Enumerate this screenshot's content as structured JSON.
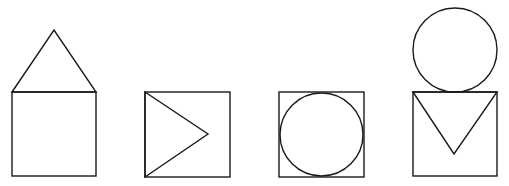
{
  "diagram": {
    "stroke_color": "#1a1a1a",
    "background": "#ffffff",
    "figures": [
      {
        "name": "triangle-above-square",
        "shapes": [
          {
            "type": "square",
            "x": 12,
            "y": 92,
            "size": 84
          },
          {
            "type": "triangle",
            "points": [
              [
                12,
                92
              ],
              [
                54,
                30
              ],
              [
                96,
                92
              ]
            ]
          }
        ]
      },
      {
        "name": "triangle-inside-square-pointing-right",
        "shapes": [
          {
            "type": "square",
            "x": 145,
            "y": 92,
            "size": 85
          },
          {
            "type": "triangle",
            "points": [
              [
                145,
                92
              ],
              [
                208,
                134
              ],
              [
                145,
                177
              ]
            ]
          }
        ]
      },
      {
        "name": "circle-inscribed-in-square",
        "shapes": [
          {
            "type": "square",
            "x": 279,
            "y": 92,
            "size": 85
          },
          {
            "type": "circle",
            "cx": 321.5,
            "cy": 134.5,
            "r": 41.5
          }
        ]
      },
      {
        "name": "circle-above-square-with-inverted-triangle",
        "shapes": [
          {
            "type": "circle",
            "cx": 455,
            "cy": 50,
            "r": 42
          },
          {
            "type": "square",
            "x": 413,
            "y": 92,
            "size": 84
          },
          {
            "type": "triangle",
            "points": [
              [
                413,
                92
              ],
              [
                454,
                154
              ],
              [
                497,
                92
              ]
            ]
          }
        ]
      }
    ]
  }
}
